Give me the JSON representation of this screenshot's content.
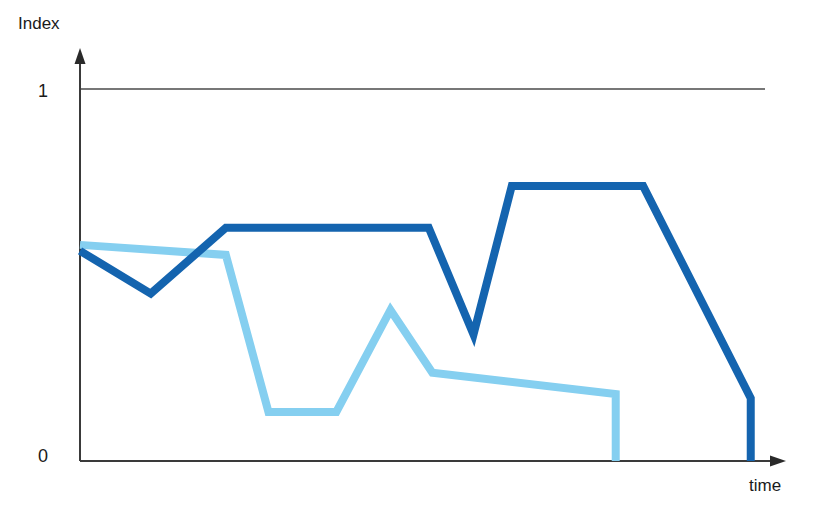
{
  "chart_data": {
    "type": "line",
    "title": "",
    "subtitle": "",
    "xlabel": "time",
    "ylabel": "Index",
    "ylim": [
      0,
      1
    ],
    "xlim": [
      0,
      1
    ],
    "grid": true,
    "gridlines": [
      1
    ],
    "legend_position": "none",
    "y_ticks": [
      "0",
      "1"
    ],
    "y_tick_values": [
      0,
      1
    ],
    "x_ticks": [],
    "annotations": [],
    "series": [
      {
        "name": "dark-blue-index",
        "color": "#1464AF",
        "x": [
          0.0,
          0.098,
          0.202,
          0.483,
          0.545,
          0.598,
          0.78,
          0.929,
          0.929
        ],
        "y": [
          0.565,
          0.45,
          0.627,
          0.627,
          0.34,
          0.739,
          0.739,
          0.169,
          0.0
        ]
      },
      {
        "name": "light-blue-index",
        "color": "#85CFF0",
        "x": [
          0.0,
          0.202,
          0.261,
          0.355,
          0.43,
          0.488,
          0.742,
          0.742
        ],
        "y": [
          0.581,
          0.554,
          0.132,
          0.132,
          0.406,
          0.237,
          0.18,
          0.0
        ]
      }
    ]
  },
  "axes": {
    "y_axis_label": "Index",
    "x_axis_label": "time",
    "y_tick_top_label": "1",
    "y_tick_bottom_label": "0"
  },
  "colors": {
    "dark_blue": "#1464AF",
    "light_blue": "#85CFF0",
    "axis": "#3a3a3a",
    "gridline": "#4a4a4a",
    "text": "#1a1a1a",
    "background": "#ffffff"
  }
}
